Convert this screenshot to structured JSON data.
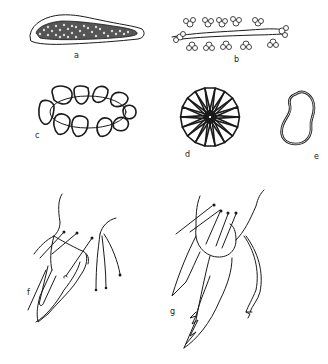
{
  "figure": {
    "panels": [
      {
        "id": "a",
        "label": "a",
        "subject": "elongated body filled with cells"
      },
      {
        "id": "b",
        "label": "b",
        "subject": "filament with lateral cell clusters"
      },
      {
        "id": "c",
        "label": "c",
        "subject": "ring of rounded cells"
      },
      {
        "id": "d",
        "label": "d",
        "subject": "radial rosette of wedge-shaped cells"
      },
      {
        "id": "e",
        "label": "e",
        "subject": "kidney-shaped single cell"
      },
      {
        "id": "f",
        "label": "f",
        "subject": "appendage with setae"
      },
      {
        "id": "g",
        "label": "g",
        "subject": "appendage with serrated claw and setae"
      }
    ],
    "ink_color": "#1a1a1a",
    "background_color": "#ffffff"
  }
}
